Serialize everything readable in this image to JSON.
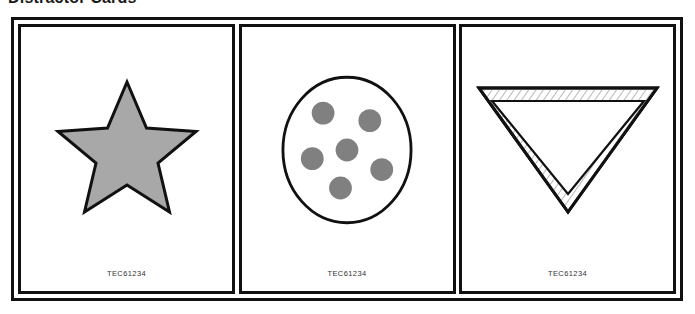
{
  "page": {
    "heading": "Distractor Cards"
  },
  "frame": {
    "border_color": "#111111",
    "background": "#ffffff"
  },
  "palette": {
    "outline": "#111111",
    "star_fill": "#a8a8a8",
    "dot_fill": "#808080",
    "card_background": "#ffffff",
    "hatch_line": "#9a9a9a",
    "code_text": "#333333"
  },
  "cards": [
    {
      "id": "card-1",
      "figure": {
        "name": "star-shape",
        "type": "star",
        "points": 5,
        "fill": "#a8a8a8",
        "stroke": "#111111",
        "orientation": "point-up"
      },
      "code": "TEC61234"
    },
    {
      "id": "card-2",
      "figure": {
        "name": "dotted-circle-shape",
        "type": "circle-with-dots",
        "fill": "#ffffff",
        "stroke": "#111111",
        "dot_count": 6,
        "dot_fill": "#808080",
        "dot_positions": [
          {
            "label": "upper-left",
            "cx": 40,
            "cy": 36,
            "r": 10.5
          },
          {
            "label": "upper-right",
            "cx": 83,
            "cy": 43,
            "r": 10.5
          },
          {
            "label": "center",
            "cx": 62,
            "cy": 70,
            "r": 10.5
          },
          {
            "label": "mid-left",
            "cx": 30,
            "cy": 78,
            "r": 10.5
          },
          {
            "label": "mid-right",
            "cx": 94,
            "cy": 88,
            "r": 10.5
          },
          {
            "label": "bottom-center",
            "cx": 56,
            "cy": 105,
            "r": 10.5
          }
        ]
      },
      "code": "TEC61234"
    },
    {
      "id": "card-3",
      "figure": {
        "name": "hatched-triangle-shape",
        "type": "triangle",
        "orientation": "point-down",
        "fill": "#ffffff",
        "stroke": "#111111",
        "border_pattern": "hatched",
        "hatch_line_color": "#9a9a9a"
      },
      "code": "TEC61234"
    }
  ]
}
